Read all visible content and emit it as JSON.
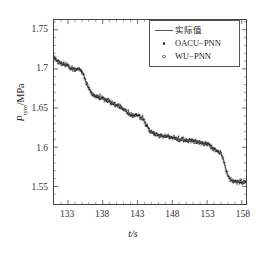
{
  "chart_data": {
    "type": "line",
    "title": "",
    "xlabel": "t/s",
    "ylabel": "P_tyre/MPa",
    "ylabel_symbol": "P",
    "ylabel_subscript": "tyre",
    "ylabel_unit": "MPa",
    "xlim": [
      131.0,
      158.6
    ],
    "ylim": [
      1.5275,
      1.7625
    ],
    "xticks": [
      133,
      138,
      143,
      148,
      153,
      158
    ],
    "xtick_labels": [
      "133",
      "138",
      "143",
      "148",
      "153",
      "158"
    ],
    "yticks": [
      1.55,
      1.6,
      1.65,
      1.7,
      1.75
    ],
    "ytick_labels": [
      "1.55",
      "1.6",
      "1.65",
      "1.7",
      "1.75"
    ],
    "grid": false,
    "legend_position": "upper right",
    "series": [
      {
        "name": "实际值",
        "marker": "line",
        "color": "#555555",
        "style": "solid-line"
      },
      {
        "name": "OACU−PNN",
        "marker": "filled-dot",
        "color": "#222222",
        "style": "scatter"
      },
      {
        "name": "WU−PNN",
        "marker": "open-circle",
        "color": "#555555",
        "style": "scatter"
      }
    ],
    "x": [
      131.0,
      131.3,
      131.6,
      131.9,
      132.2,
      132.5,
      132.8,
      133.1,
      133.4,
      133.7,
      134.0,
      134.3,
      134.6,
      134.9,
      135.2,
      135.5,
      135.8,
      136.1,
      136.4,
      136.7,
      137.0,
      137.3,
      137.6,
      137.9,
      138.2,
      138.5,
      138.8,
      139.1,
      139.4,
      139.7,
      140.0,
      140.3,
      140.6,
      140.9,
      141.2,
      141.5,
      141.8,
      142.1,
      142.4,
      142.7,
      143.0,
      143.3,
      143.6,
      143.9,
      144.2,
      144.5,
      144.8,
      145.1,
      145.4,
      145.7,
      146.0,
      146.3,
      146.6,
      146.9,
      147.2,
      147.5,
      147.8,
      148.1,
      148.4,
      148.7,
      149.0,
      149.3,
      149.6,
      149.9,
      150.2,
      150.5,
      150.8,
      151.1,
      151.4,
      151.7,
      152.0,
      152.3,
      152.6,
      152.9,
      153.2,
      153.5,
      153.8,
      154.1,
      154.4,
      154.7,
      155.0,
      155.3,
      155.6,
      155.9,
      156.2,
      156.5,
      156.8,
      157.1,
      157.4,
      157.7,
      158.0,
      158.3,
      158.6
    ],
    "y_actual": [
      1.715,
      1.712,
      1.7095,
      1.708,
      1.707,
      1.7065,
      1.7055,
      1.7035,
      1.701,
      1.7005,
      1.7,
      1.7005,
      1.7,
      1.698,
      1.693,
      1.686,
      1.679,
      1.673,
      1.669,
      1.6665,
      1.665,
      1.6645,
      1.6635,
      1.6625,
      1.662,
      1.6615,
      1.66,
      1.658,
      1.656,
      1.6545,
      1.653,
      1.652,
      1.651,
      1.6495,
      1.6475,
      1.645,
      1.643,
      1.642,
      1.6415,
      1.641,
      1.6405,
      1.6395,
      1.6375,
      1.634,
      1.6295,
      1.625,
      1.6215,
      1.619,
      1.6175,
      1.6165,
      1.6155,
      1.615,
      1.6145,
      1.614,
      1.6135,
      1.613,
      1.6125,
      1.612,
      1.6115,
      1.611,
      1.6105,
      1.6105,
      1.61,
      1.6095,
      1.609,
      1.6085,
      1.608,
      1.6075,
      1.607,
      1.6065,
      1.606,
      1.6055,
      1.605,
      1.604,
      1.603,
      1.601,
      1.599,
      1.5975,
      1.596,
      1.5945,
      1.592,
      1.586,
      1.576,
      1.566,
      1.56,
      1.5575,
      1.5565,
      1.556,
      1.5555,
      1.555,
      1.5555,
      1.556,
      1.5555
    ]
  },
  "legend": {
    "items": [
      {
        "label": "实际值",
        "marker": "line"
      },
      {
        "label": "OACU−PNN",
        "marker": "filled-dot"
      },
      {
        "label": "WU−PNN",
        "marker": "open-circle"
      }
    ]
  }
}
